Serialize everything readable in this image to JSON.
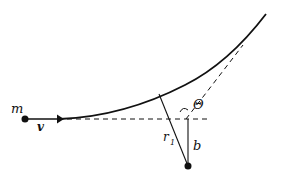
{
  "diagram": {
    "labels": {
      "mass": "m",
      "velocity": "v",
      "angle": "Θ",
      "distance": "r",
      "distance_sub": "1",
      "impact_parameter": "b"
    },
    "colors": {
      "stroke": "#111111",
      "background": "#ffffff"
    }
  }
}
